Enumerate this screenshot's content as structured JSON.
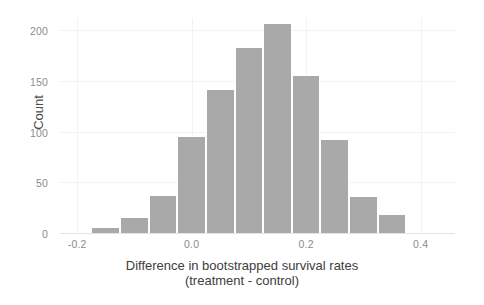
{
  "chart_data": {
    "type": "bar",
    "subtype": "histogram",
    "title": "",
    "xlabel": "Difference in bootstrapped survival rates",
    "xlabel_line2": "(treatment - control)",
    "ylabel": "Count",
    "bin_width": 0.05,
    "bin_left_edges": [
      -0.175,
      -0.125,
      -0.075,
      -0.025,
      0.025,
      0.075,
      0.125,
      0.175,
      0.225,
      0.275,
      0.325
    ],
    "bin_centers": [
      -0.15,
      -0.1,
      -0.05,
      0.0,
      0.05,
      0.1,
      0.15,
      0.2,
      0.25,
      0.3,
      0.35
    ],
    "values": [
      7,
      17,
      38,
      97,
      143,
      184,
      208,
      157,
      94,
      37,
      20
    ],
    "categories": [
      "-0.15",
      "-0.10",
      "-0.05",
      "0.00",
      "0.05",
      "0.10",
      "0.15",
      "0.20",
      "0.25",
      "0.30",
      "0.35"
    ],
    "xlim": [
      -0.23,
      0.46
    ],
    "ylim": [
      0,
      213
    ],
    "xticks": [
      -0.2,
      0.0,
      0.2,
      0.4
    ],
    "xtick_labels": [
      "-0.2",
      "0.0",
      "0.2",
      "0.4"
    ],
    "yticks": [
      0,
      50,
      100,
      150,
      200
    ],
    "ytick_labels": [
      "0",
      "50",
      "100",
      "150",
      "200"
    ],
    "grid": true,
    "legend": false,
    "bar_color": "#a9a9a9",
    "grid_color": "#f2f2f2",
    "background_color": "#ffffff",
    "tick_label_color": "#8c8c8c",
    "axis_label_color": "#3d3d3d"
  }
}
